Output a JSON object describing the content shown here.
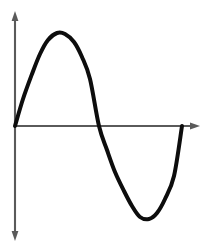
{
  "figure": {
    "background_color": "#ffffff",
    "width": 211,
    "height": 250
  },
  "axes": {
    "origin": {
      "x": 15,
      "y": 126
    },
    "x_axis": {
      "name": "horizontal-axis",
      "color": "#5a5a5a",
      "start": {
        "x": 15,
        "y": 126
      },
      "end": {
        "x": 198,
        "y": 126
      },
      "arrow": "right",
      "label": ""
    },
    "y_axis": {
      "name": "vertical-axis",
      "color": "#5a5a5a",
      "top": {
        "x": 15,
        "y": 13
      },
      "bottom": {
        "x": 15,
        "y": 239
      },
      "arrow": "both",
      "label": ""
    }
  },
  "chart_data": {
    "type": "line",
    "title": "",
    "subtitle": "",
    "xlabel": "",
    "ylabel": "",
    "grid": false,
    "legend": null,
    "curve_color": "#0d0d0d",
    "curve_width": 4,
    "function": "y = A sin(2*pi*x / T)",
    "amplitude_px": 93,
    "period_px": 167,
    "x_pixel_range": [
      15,
      182
    ],
    "y_pixel_range": [
      33,
      219
    ],
    "key_points": [
      {
        "label": "start / origin",
        "x": 15,
        "y": 126,
        "phase": "0"
      },
      {
        "label": "crest / maximum",
        "x": 57,
        "y": 33,
        "phase": "T/4"
      },
      {
        "label": "zero crossing",
        "x": 99,
        "y": 126,
        "phase": "T/2"
      },
      {
        "label": "trough / minimum",
        "x": 140,
        "y": 219,
        "phase": "3T/4"
      },
      {
        "label": "end",
        "x": 182,
        "y": 126,
        "phase": "T"
      }
    ],
    "x": [
      15,
      23,
      32,
      40,
      48,
      57,
      65,
      74,
      82,
      90,
      99,
      107,
      115,
      124,
      132,
      140,
      149,
      157,
      165,
      174,
      182
    ],
    "y": [
      126,
      99,
      74,
      54,
      40,
      33,
      34,
      42,
      57,
      79,
      126,
      150,
      172,
      191,
      206,
      217,
      219,
      213,
      199,
      176,
      126
    ],
    "values_normalized": [
      0,
      0.29,
      0.56,
      0.77,
      0.92,
      1.0,
      0.99,
      0.9,
      0.74,
      0.5,
      0,
      -0.26,
      -0.49,
      -0.7,
      -0.86,
      -0.98,
      -1.0,
      -0.93,
      -0.78,
      -0.54,
      0
    ]
  }
}
